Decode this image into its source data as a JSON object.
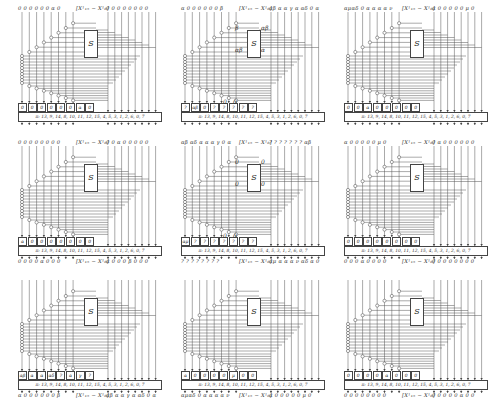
{
  "figure": {
    "layout": "3x3 grid of bit-wise permutation/S-box propagation diagrams",
    "sbox_label": "S",
    "permutation_label": "π: 13, 9, 14, 8, 10, 11, 12, 15, 4, 5, 3, 1, 2, 6, 0, 7",
    "center_label": "[X_{15}^i − X_8^i]",
    "panels": [
      {
        "id": "r1c1",
        "top_left": "0 0 0 0 0 0 α 0",
        "top_right": "0 0 0 0 0 0 0 0",
        "cells": [
          "0",
          "0",
          "0",
          "0",
          "0",
          "0",
          "α",
          "0"
        ],
        "annotations": []
      },
      {
        "id": "r1c2",
        "top_left": "α 0 0 0 0 0 0 β",
        "top_right": "αβ α α γ α αδ 0 α",
        "cells": [
          "?",
          "αβ",
          "0",
          "?",
          "?",
          "?",
          "?",
          "?"
        ],
        "annotations": [
          "β",
          "αβ",
          "αβ",
          "α",
          "0",
          "0"
        ]
      },
      {
        "id": "r1c3",
        "top_left": "αμαδ 0 α α α α ν",
        "top_right": "α 0 0 0 0 0 μ 0",
        "cells": [
          "0",
          "0",
          "α",
          "0",
          "0",
          "0",
          "0",
          "0"
        ],
        "annotations": []
      },
      {
        "id": "r2c1",
        "top_left": "0 0 0 0 0 0 0 0",
        "top_right": "0 0 α 0 0 0 0 0",
        "bottom_left": "0 0 0 0 α 0 0 0",
        "bottom_right": "α 0 0 0 β 0 0 0",
        "cells": [
          "α",
          "0",
          "0",
          "0",
          "0",
          "0",
          "0",
          "0"
        ],
        "annotations": []
      },
      {
        "id": "r2c2",
        "top_left": "αβ αδ α α α γ 0 α",
        "top_right": "? ? ? ? ? ? ? αβ",
        "bottom_left": "? ? ? ? ? ? ? ?",
        "bottom_right": "αμ α α α ν αδ α 0",
        "cells": [
          "αμ",
          "?",
          "?",
          "?",
          "?",
          "?",
          "?",
          "?"
        ],
        "annotations": [
          "0",
          "0",
          "0",
          "0",
          "0",
          "0"
        ]
      },
      {
        "id": "r2c3",
        "top_left": "α 0 0 0 0 0 μ 0",
        "top_right": "0 α 0 0 0 0 0 0",
        "bottom_left": "0 0 0 α 0 0 0 0",
        "bottom_right": "0 0 0 0 0 0 0 0",
        "cells": [
          "0",
          "0",
          "0",
          "0",
          "0",
          "0",
          "0",
          "0"
        ],
        "annotations": []
      },
      {
        "id": "r3c1",
        "bottom_left": "α 0 0 0 0 0 0 β",
        "bottom_right": "αβ α α γ α αδ 0 α",
        "cells": [
          "αβ",
          "α",
          "α",
          "αδ",
          "?",
          "α",
          "γ",
          "?"
        ],
        "annotations": []
      },
      {
        "id": "r3c2",
        "bottom_left": "αμαδ 0 α α α α ν",
        "bottom_right": "α 0 0 0 0 0 μ 0",
        "cells": [
          "α",
          "0",
          "0",
          "0",
          "0",
          "μ",
          "0",
          "0"
        ],
        "annotations": []
      },
      {
        "id": "r3c3",
        "bottom_left": "0 0 0 0 0 0 0 0",
        "bottom_right": "0 0 0 0 0 α 0 0",
        "cells": [
          "0",
          "0",
          "0",
          "0",
          "α",
          "0",
          "0",
          "0"
        ],
        "annotations": []
      }
    ]
  }
}
